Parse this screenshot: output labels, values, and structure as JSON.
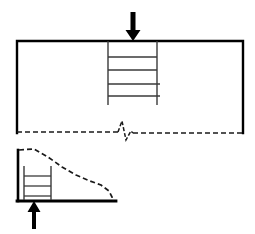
{
  "figure": {
    "canvas": {
      "width": 255,
      "height": 234,
      "background": "#ffffff"
    },
    "colors": {
      "solid_line": "#000000",
      "dashed_line": "#1a1a1a",
      "hatch_line": "#3a3a3a",
      "arrow_fill": "#000000"
    }
  },
  "upper_view": {
    "name": "full-specimen-view",
    "body_outline": {
      "label": "specimen-body",
      "left": 17,
      "top": 41,
      "right": 243,
      "bottom": 133,
      "solid_sides": [
        "top",
        "left",
        "right"
      ],
      "bottom_style": "dashed"
    },
    "load_arrow": {
      "label": "applied-load-arrow",
      "direction": "down",
      "x": 133,
      "tail_y": 12,
      "tip_y": 41,
      "shaft_width": 5,
      "head_width": 15,
      "head_height": 11
    },
    "stress_column": {
      "label": "stress-distribution-column",
      "left": 108,
      "right": 157,
      "top": 41,
      "bottom": 105,
      "rung_count": 4,
      "rung_y": [
        57,
        70,
        84,
        96
      ],
      "rung_widths": [
        49,
        49,
        52,
        52
      ]
    },
    "crack": {
      "label": "zigzag-crack-break",
      "points": [
        [
          118,
          132
        ],
        [
          122,
          121
        ],
        [
          126,
          140
        ],
        [
          131,
          131
        ],
        [
          133,
          133
        ]
      ],
      "left_dash_start_x": 17,
      "left_dash_end_x": 118,
      "left_dash_y": 132,
      "right_dash_start_x": 133,
      "right_dash_end_x": 243,
      "right_dash_y": 133
    }
  },
  "lower_view": {
    "name": "detail-specimen-view",
    "base_line": {
      "label": "support-base-line",
      "x1": 17,
      "x2": 116,
      "y": 201
    },
    "left_edge": {
      "label": "left-vertical-edge",
      "x": 18,
      "y1": 150,
      "y2": 201
    },
    "reaction_arrow": {
      "label": "reaction-force-arrow",
      "direction": "up",
      "x": 34,
      "tail_y": 229,
      "tip_y": 201,
      "shaft_width": 4,
      "head_width": 13,
      "head_height": 11
    },
    "stress_column": {
      "label": "stress-distribution-column",
      "left": 24,
      "right": 51,
      "top": 166,
      "bottom": 200,
      "rung_count": 3,
      "rung_y": [
        176,
        186,
        196
      ]
    },
    "stress_envelope": {
      "label": "stress-envelope-curve",
      "style": "dashed",
      "points": [
        [
          19,
          150
        ],
        [
          34,
          149
        ],
        [
          48,
          157
        ],
        [
          62,
          167
        ],
        [
          76,
          175
        ],
        [
          90,
          181
        ],
        [
          101,
          185
        ],
        [
          109,
          191
        ],
        [
          112,
          197
        ],
        [
          113,
          201
        ]
      ]
    }
  },
  "dash_patterns": {
    "envelope": "5 3",
    "bottom_edge": "5 3",
    "crack": "4 2"
  },
  "stroke_widths": {
    "outline": 2.4,
    "base": 2.8,
    "hatch": 1.3,
    "dashed": 1.6
  }
}
